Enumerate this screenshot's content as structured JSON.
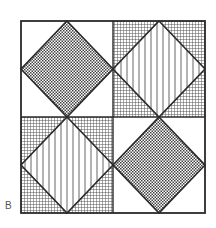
{
  "figure": {
    "label": "B",
    "cells": [
      {
        "position": "top-left",
        "diamond_fill": "checkerboard",
        "corner_fill": "plain"
      },
      {
        "position": "top-right",
        "diamond_fill": "vertical-stripes",
        "corner_fill": "fine-grid"
      },
      {
        "position": "bottom-left",
        "diamond_fill": "vertical-stripes",
        "corner_fill": "fine-grid"
      },
      {
        "position": "bottom-right",
        "diamond_fill": "checkerboard",
        "corner_fill": "plain"
      }
    ],
    "colors": {
      "line": "#2a2a2a",
      "background": "#ffffff",
      "pattern": "#555555"
    }
  }
}
